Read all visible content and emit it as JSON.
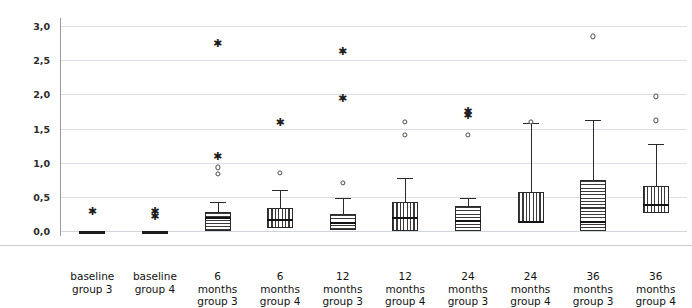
{
  "chart_data": {
    "type": "boxplot",
    "title": "",
    "xlabel": "",
    "ylabel": "bone level (mm)",
    "ylim": [
      0.0,
      3.0
    ],
    "ytick_labels": [
      "0,0",
      "0,5",
      "1,0",
      "1,5",
      "2,0",
      "2,5",
      "3,0"
    ],
    "ytick_values": [
      0.0,
      0.5,
      1.0,
      1.5,
      2.0,
      2.5,
      3.0
    ],
    "grid": "horizontal",
    "legend": "none",
    "categories": [
      "baseline group 3",
      "baseline group 4",
      "6 months group 3",
      "6 months group 4",
      "12 months group 3",
      "12 months group 4",
      "24 months group 3",
      "24 months group 4",
      "36 months group 3",
      "36 months group 4"
    ],
    "category_lines": [
      [
        "baseline",
        "group 3"
      ],
      [
        "baseline",
        "group 4"
      ],
      [
        "6",
        "months",
        "group 3"
      ],
      [
        "6",
        "months",
        "group 4"
      ],
      [
        "12",
        "months",
        "group 3"
      ],
      [
        "12",
        "months",
        "group 4"
      ],
      [
        "24",
        "months",
        "group 3"
      ],
      [
        "24",
        "months",
        "group 4"
      ],
      [
        "36",
        "months",
        "group 3"
      ],
      [
        "36",
        "months",
        "group 4"
      ]
    ],
    "boxes": [
      {
        "category": "baseline group 3",
        "hatch": "none",
        "flat": true,
        "whisker_low": 0.0,
        "q1": 0.0,
        "median": 0.0,
        "q3": 0.0,
        "whisker_high": 0.0,
        "outliers_circle": [],
        "outliers_star": [
          0.3
        ]
      },
      {
        "category": "baseline group 4",
        "hatch": "none",
        "flat": true,
        "whisker_low": 0.0,
        "q1": 0.0,
        "median": 0.0,
        "q3": 0.0,
        "whisker_high": 0.0,
        "outliers_circle": [],
        "outliers_star": [
          0.3,
          0.22
        ]
      },
      {
        "category": "6 months group 3",
        "hatch": "horizontal",
        "flat": false,
        "whisker_low": 0.0,
        "q1": 0.0,
        "median": 0.2,
        "q3": 0.28,
        "whisker_high": 0.42,
        "outliers_circle": [
          0.93,
          0.83
        ],
        "outliers_star": [
          2.75,
          1.1
        ]
      },
      {
        "category": "6 months group 4",
        "hatch": "vertical",
        "flat": false,
        "whisker_low": 0.0,
        "q1": 0.04,
        "median": 0.18,
        "q3": 0.33,
        "whisker_high": 0.6,
        "outliers_circle": [
          0.85
        ],
        "outliers_star": [
          1.6
        ]
      },
      {
        "category": "12 months group 3",
        "hatch": "horizontal",
        "flat": false,
        "whisker_low": 0.0,
        "q1": 0.02,
        "median": 0.13,
        "q3": 0.25,
        "whisker_high": 0.48,
        "outliers_circle": [
          0.7
        ],
        "outliers_star": [
          2.63,
          1.95
        ]
      },
      {
        "category": "12 months group 4",
        "hatch": "vertical",
        "flat": false,
        "whisker_low": 0.0,
        "q1": 0.0,
        "median": 0.2,
        "q3": 0.42,
        "whisker_high": 0.78,
        "outliers_circle": [
          1.6,
          1.41
        ],
        "outliers_star": []
      },
      {
        "category": "24 months group 3",
        "hatch": "horizontal",
        "flat": false,
        "whisker_low": 0.0,
        "q1": 0.0,
        "median": 0.16,
        "q3": 0.36,
        "whisker_high": 0.49,
        "outliers_circle": [
          1.41
        ],
        "outliers_star": [
          1.75,
          1.7
        ]
      },
      {
        "category": "24 months group 4",
        "hatch": "vertical",
        "flat": false,
        "whisker_low": 0.0,
        "q1": 0.12,
        "median": 0.14,
        "q3": 0.57,
        "whisker_high": 1.58,
        "outliers_circle": [
          1.6
        ],
        "outliers_star": []
      },
      {
        "category": "36 months group 3",
        "hatch": "horizontal",
        "flat": false,
        "whisker_low": 0.0,
        "q1": 0.0,
        "median": 0.14,
        "q3": 0.74,
        "whisker_high": 1.63,
        "outliers_circle": [
          2.85
        ],
        "outliers_star": []
      },
      {
        "category": "36 months group 4",
        "hatch": "vertical",
        "flat": false,
        "whisker_low": 0.0,
        "q1": 0.26,
        "median": 0.4,
        "q3": 0.66,
        "whisker_high": 1.28,
        "outliers_circle": [
          1.97,
          1.62
        ],
        "outliers_star": []
      }
    ],
    "colors": {
      "gridline": "#dcdfe3",
      "axis": "#9a9a9a",
      "box_outline": "#2a2a2a",
      "hatch": "#3a3a3a",
      "median": "#141414",
      "text": "#121212",
      "background": "#ffffff"
    }
  }
}
